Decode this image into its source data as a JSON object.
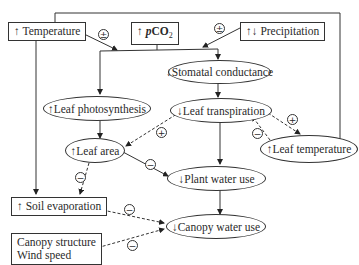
{
  "boxes": {
    "temperature": {
      "arrow": "↑",
      "label": "Temperature"
    },
    "pco2": {
      "arrow": "↑",
      "label_p": "p",
      "label_co": "CO",
      "label_sub": "2"
    },
    "precipitation": {
      "arrow": "↑↓",
      "label": "Precipitation"
    },
    "soil_evaporation": {
      "arrow": "↑",
      "label": "Soil evaporation"
    },
    "canopy": {
      "line1": "Canopy structure",
      "line2": "Wind speed"
    }
  },
  "ovals": {
    "stomatal_conductance": {
      "arrow": "↓",
      "label": "Stomatal conductance"
    },
    "leaf_photosynthesis": {
      "arrow": "↑",
      "label": "Leaf photosynthesis"
    },
    "leaf_transpiration": {
      "arrow": "↓",
      "label": "Leaf transpiration"
    },
    "leaf_area": {
      "arrow": "↑",
      "label": "Leaf area"
    },
    "leaf_temperature": {
      "arrow": "↑",
      "label": "Leaf temperature"
    },
    "plant_water_use": {
      "arrow": "↓",
      "label": "Plant water use"
    },
    "canopy_water_use": {
      "arrow": "↓",
      "label": "Canopy water use"
    }
  },
  "signs": {
    "temperature_to_system": "±",
    "precip_to_system": "±",
    "transpiration_to_leaf_area": "+",
    "leaf_area_to_plant_water": "−",
    "transpiration_to_leaf_temp": "+",
    "leaf_temp_to_transpiration": "−",
    "leaf_area_to_soil_evap": "−",
    "soil_evap_to_canopy_water": "−",
    "canopy_to_canopy_water": "−"
  }
}
